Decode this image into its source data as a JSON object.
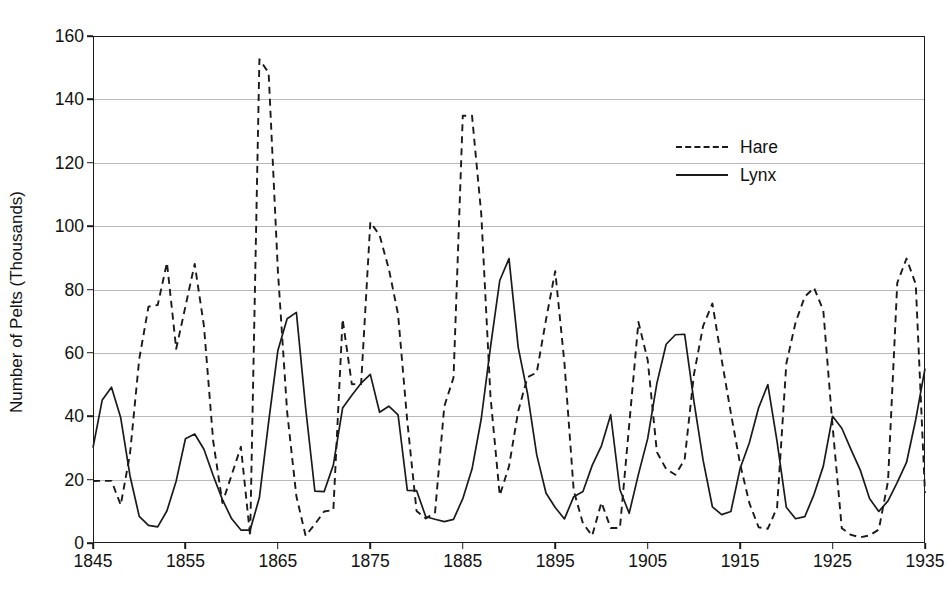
{
  "chart_data": {
    "type": "line",
    "title": "",
    "xlabel": "",
    "ylabel": "Number of Pelts (Thousands)",
    "xlim": [
      1845,
      1935
    ],
    "ylim": [
      0,
      160
    ],
    "grid": true,
    "legend_position": "upper-right-inside",
    "xticks": [
      1845,
      1855,
      1865,
      1875,
      1885,
      1895,
      1905,
      1915,
      1925,
      1935
    ],
    "yticks": [
      0,
      20,
      40,
      60,
      80,
      100,
      120,
      140,
      160
    ],
    "x": [
      1845,
      1846,
      1847,
      1848,
      1849,
      1850,
      1851,
      1852,
      1853,
      1854,
      1855,
      1856,
      1857,
      1858,
      1859,
      1860,
      1861,
      1862,
      1863,
      1864,
      1865,
      1866,
      1867,
      1868,
      1869,
      1870,
      1871,
      1872,
      1873,
      1874,
      1875,
      1876,
      1877,
      1878,
      1879,
      1880,
      1881,
      1882,
      1883,
      1884,
      1885,
      1886,
      1887,
      1888,
      1889,
      1890,
      1891,
      1892,
      1893,
      1894,
      1895,
      1896,
      1897,
      1898,
      1899,
      1900,
      1901,
      1902,
      1903,
      1904,
      1905,
      1906,
      1907,
      1908,
      1909,
      1910,
      1911,
      1912,
      1913,
      1914,
      1915,
      1916,
      1917,
      1918,
      1919,
      1920,
      1921,
      1922,
      1923,
      1924,
      1925,
      1926,
      1927,
      1928,
      1929,
      1930,
      1931,
      1932,
      1933,
      1934,
      1935
    ],
    "series": [
      {
        "name": "Hare",
        "style": "dashed",
        "color": "#1a1a1a",
        "values": [
          19.58,
          19.6,
          19.61,
          11.99,
          28.04,
          58.0,
          74.6,
          75.09,
          88.48,
          61.28,
          74.67,
          88.06,
          68.51,
          32.19,
          12.64,
          21.49,
          30.35,
          2.18,
          152.65,
          148.36,
          85.81,
          41.41,
          14.75,
          2.28,
          5.91,
          9.95,
          10.44,
          70.64,
          50.12,
          50.13,
          101.25,
          97.12,
          86.51,
          72.17,
          38.32,
          10.11,
          7.74,
          9.67,
          43.12,
          52.21,
          134.85,
          134.86,
          103.79,
          46.1,
          15.03,
          24.2,
          41.65,
          52.34,
          53.78,
          70.4,
          85.81,
          56.69,
          16.59,
          6.16,
          2.3,
          12.82,
          4.72,
          4.73,
          37.22,
          69.72,
          57.78,
          28.68,
          23.37,
          21.54,
          26.34,
          53.1,
          68.48,
          75.58,
          57.92,
          40.97,
          24.95,
          12.59,
          4.97,
          4.5,
          11.21,
          56.6,
          69.63,
          77.74,
          80.53,
          73.38,
          36.93,
          4.64,
          2.54,
          1.8,
          2.39,
          4.23,
          19.52,
          82.11,
          89.76,
          81.66,
          15.76
        ]
      },
      {
        "name": "Lynx",
        "style": "solid",
        "color": "#1a1a1a",
        "values": [
          30.09,
          45.15,
          49.15,
          39.52,
          21.23,
          8.42,
          5.56,
          5.08,
          10.17,
          19.6,
          32.91,
          34.38,
          29.59,
          21.3,
          13.69,
          7.65,
          4.08,
          4.09,
          14.33,
          38.22,
          60.78,
          70.77,
          72.77,
          42.68,
          16.39,
          16.2,
          24.66,
          42.59,
          46.65,
          50.43,
          53.21,
          41.25,
          43.16,
          40.47,
          16.59,
          16.55,
          8.28,
          7.49,
          6.77,
          7.47,
          14.0,
          23.34,
          39.21,
          61.88,
          82.84,
          89.76,
          61.66,
          47.19,
          27.81,
          15.76,
          11.18,
          7.6,
          14.62,
          16.24,
          24.5,
          30.67,
          40.48,
          16.8,
          9.38,
          21.66,
          32.93,
          50.46,
          62.72,
          65.72,
          65.88,
          44.77,
          26.07,
          11.43,
          8.96,
          9.93,
          23.5,
          31.66,
          42.66,
          49.99,
          31.99,
          11.26,
          7.65,
          8.33,
          15.36,
          24.26,
          40.0,
          36.22,
          29.45,
          23.0,
          14.05,
          9.95,
          13.28,
          19.1,
          25.41,
          38.99,
          55.0
        ]
      }
    ]
  },
  "axes": {
    "y_title": "Number of Pelts (Thousands)",
    "y_tick_labels": [
      "160",
      "140",
      "120",
      "100",
      "80",
      "60",
      "40",
      "20",
      "0"
    ],
    "x_tick_labels": [
      "1845",
      "1855",
      "1865",
      "1875",
      "1885",
      "1895",
      "1905",
      "1915",
      "1925",
      "1935"
    ]
  },
  "legend": {
    "entries": [
      {
        "label": "Hare",
        "style": "dashed"
      },
      {
        "label": "Lynx",
        "style": "solid"
      }
    ]
  },
  "colors": {
    "line": "#1a1a1a",
    "grid": "#b9b9b9",
    "frame": "#1a1a1a",
    "background": "#ffffff"
  }
}
